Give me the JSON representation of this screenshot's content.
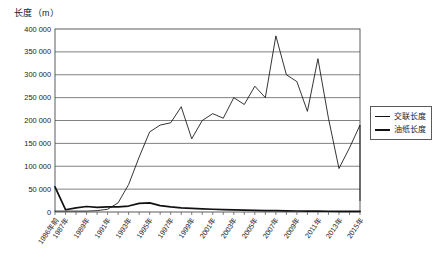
{
  "chart_data": {
    "type": "line",
    "title": "",
    "ylabel": "长度（m）",
    "xlabel": "",
    "ylim": [
      0,
      400000
    ],
    "ytick_step": 50000,
    "grid": true,
    "legend_position": "right",
    "ytick_labels": [
      "400 000",
      "350 000",
      "300 000",
      "250 000",
      "200 000",
      "150 000",
      "100 000",
      "50 000",
      "0"
    ],
    "ytick_values": [
      400000,
      350000,
      300000,
      250000,
      200000,
      150000,
      100000,
      50000,
      0
    ],
    "x": [
      "1986年前",
      "1987年",
      "1988年",
      "1989年",
      "1990年",
      "1991年",
      "1992年",
      "1993年",
      "1994年",
      "1995年",
      "1996年",
      "1997年",
      "1998年",
      "1999年",
      "2000年",
      "2001年",
      "2002年",
      "2003年",
      "2004年",
      "2005年",
      "2006年",
      "2007年",
      "2008年",
      "2009年",
      "2010年",
      "2011年",
      "2012年",
      "2013年",
      "2014年",
      "2015年"
    ],
    "xtick_labels_shown": [
      "1986年前",
      "1987年",
      "1989年",
      "1991年",
      "1993年",
      "1995年",
      "1997年",
      "1999年",
      "2001年",
      "2003年",
      "2005年",
      "2007年",
      "2009年",
      "2011年",
      "2013年",
      "2015年"
    ],
    "series": [
      {
        "name": "交联长度",
        "line_width": "thin",
        "color": "#111111",
        "values": [
          2000,
          2000,
          2000,
          2000,
          3000,
          6000,
          20000,
          60000,
          120000,
          175000,
          190000,
          195000,
          230000,
          160000,
          200000,
          215000,
          205000,
          250000,
          235000,
          275000,
          250000,
          385000,
          300000,
          285000,
          220000,
          335000,
          205000,
          95000,
          140000,
          190000
        ]
      },
      {
        "name": "油纸长度",
        "line_width": "thick",
        "color": "#111111",
        "values": [
          55000,
          5000,
          9000,
          12000,
          10000,
          11000,
          11000,
          13000,
          19000,
          20000,
          14000,
          11000,
          9000,
          8000,
          7000,
          6000,
          5000,
          4500,
          4000,
          3500,
          3000,
          2800,
          2500,
          2200,
          2000,
          1800,
          1600,
          1500,
          1400,
          1300
        ]
      }
    ],
    "final_drop_value": 25000,
    "legend": [
      {
        "label": "交联长度",
        "style": "thin"
      },
      {
        "label": "油纸长度",
        "style": "thick"
      }
    ]
  },
  "plot": {
    "left": 55,
    "right": 360,
    "top": 29,
    "bottom": 212
  }
}
